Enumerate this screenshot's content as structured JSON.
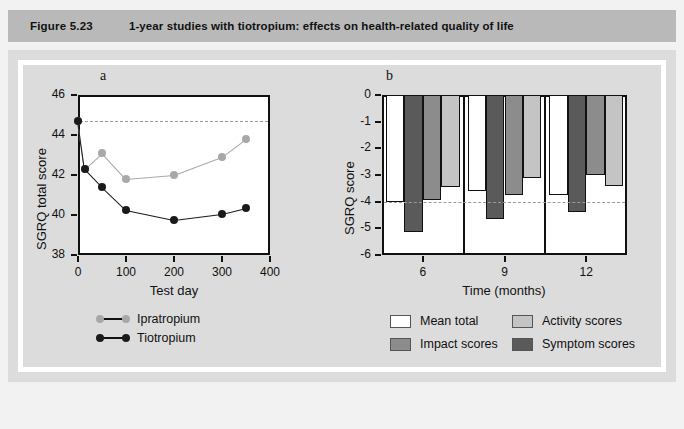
{
  "figure": {
    "number": "Figure 5.23",
    "title": "1-year studies with tiotropium: effects on health-related quality of life"
  },
  "colors": {
    "title_bar": "#b9b9b9",
    "panel_bg": "#dcdcdc",
    "page_bg": "#f2f2f2",
    "ipratropium": "#a8a8a8",
    "tiotropium": "#1a1a1a",
    "mean_total": "#ffffff",
    "impact_scores": "#8c8c8c",
    "activity_scores": "#c4c4c4",
    "symptom_scores": "#5a5a5a",
    "axis": "#111111",
    "dashed_reference": "#9a9a9a"
  },
  "panel_a": {
    "letter": "a",
    "ylabel": "SGRQ total score",
    "xlabel": "Test day",
    "yticks": [
      "38",
      "40",
      "42",
      "44",
      "46"
    ],
    "xticks": [
      "0",
      "100",
      "200",
      "300",
      "400"
    ],
    "legend": [
      {
        "label": "Ipratropium",
        "key": "ipratropium"
      },
      {
        "label": "Tiotropium",
        "key": "tiotropium"
      }
    ]
  },
  "panel_b": {
    "letter": "b",
    "ylabel": "SGRQ score",
    "xlabel": "Time (months)",
    "yticks": [
      "0",
      "-1",
      "-2",
      "-3",
      "-4",
      "-5",
      "-6"
    ],
    "xticks": [
      "6",
      "9",
      "12"
    ],
    "legend": [
      {
        "label": "Mean total",
        "key": "mean_total"
      },
      {
        "label": "Activity scores",
        "key": "activity_scores"
      },
      {
        "label": "Impact scores",
        "key": "impact_scores"
      },
      {
        "label": "Symptom scores",
        "key": "symptom_scores"
      }
    ]
  },
  "chart_data": [
    {
      "type": "line",
      "panel": "a",
      "title": "SGRQ total score over 1 year",
      "xlabel": "Test day",
      "ylabel": "SGRQ total score",
      "xlim": [
        0,
        400
      ],
      "ylim": [
        38,
        46
      ],
      "xticks": [
        0,
        100,
        200,
        300,
        400
      ],
      "yticks": [
        38,
        40,
        42,
        44,
        46
      ],
      "grid": false,
      "legend_position": "below-left",
      "reference_line": {
        "value": 44.7,
        "style": "dashed",
        "label": "baseline"
      },
      "series": [
        {
          "name": "Ipratropium",
          "color": "#a8a8a8",
          "x": [
            0,
            14,
            50,
            100,
            200,
            300,
            350
          ],
          "y": [
            44.7,
            42.3,
            43.1,
            41.8,
            42.0,
            42.9,
            43.8
          ]
        },
        {
          "name": "Tiotropium",
          "color": "#1a1a1a",
          "x": [
            0,
            14,
            50,
            100,
            200,
            300,
            350
          ],
          "y": [
            44.7,
            42.3,
            41.4,
            40.25,
            39.75,
            40.05,
            40.35
          ]
        }
      ]
    },
    {
      "type": "bar",
      "panel": "b",
      "title": "SGRQ score change by domain",
      "xlabel": "Time (months)",
      "ylabel": "SGRQ score",
      "ylim": [
        -6,
        0
      ],
      "yticks": [
        0,
        -1,
        -2,
        -3,
        -4,
        -5,
        -6
      ],
      "grid": false,
      "legend_position": "below",
      "reference_line": {
        "value": -4,
        "style": "dashed",
        "label": "clinically significant change"
      },
      "categories": [
        "6",
        "9",
        "12"
      ],
      "series": [
        {
          "name": "Mean total",
          "color": "#ffffff",
          "values": [
            -4.0,
            -3.6,
            -3.75
          ]
        },
        {
          "name": "Symptom scores",
          "color": "#5a5a5a",
          "values": [
            -5.15,
            -4.65,
            -4.4
          ]
        },
        {
          "name": "Impact scores",
          "color": "#8c8c8c",
          "values": [
            -3.95,
            -3.75,
            -3.0
          ]
        },
        {
          "name": "Activity scores",
          "color": "#c4c4c4",
          "values": [
            -3.45,
            -3.1,
            -3.4
          ]
        }
      ]
    }
  ]
}
